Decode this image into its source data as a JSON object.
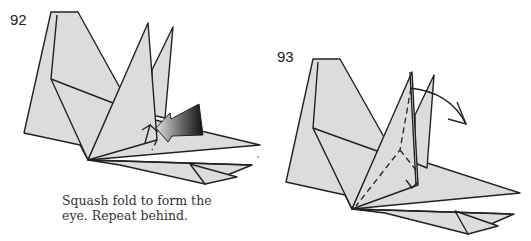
{
  "steps": [
    {
      "number": "92",
      "caption_line1": "Squash fold to form the",
      "caption_line2": "eye.  Repeat behind.",
      "symbols": [
        "push-arrow",
        "squash-fold-arrow"
      ]
    },
    {
      "number": "93",
      "caption_line1": "",
      "caption_line2": "",
      "symbols": [
        "valley-fold-dashed-line",
        "curved-fold-arrow"
      ]
    }
  ],
  "colors": {
    "paper": "#dcdcdc",
    "line": "#222222",
    "push_arrow_dark": "#1a1a1a",
    "push_arrow_light": "#d8d8d8"
  }
}
